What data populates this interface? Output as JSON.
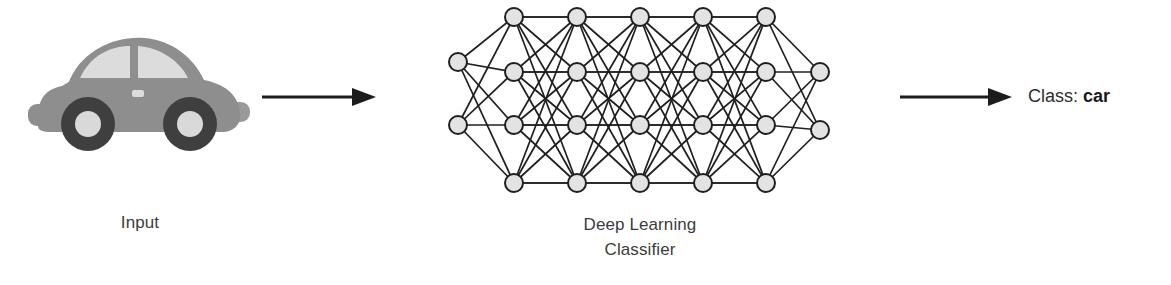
{
  "figure": {
    "background_color": "#ffffff"
  },
  "input": {
    "caption": "Input",
    "icon": "car-icon",
    "colors": {
      "body": "#8e8e8e",
      "body_shade": "#9a9a9a",
      "window": "#dcdcdc",
      "tire": "#3f3f3f",
      "hub": "#d9d9d9",
      "outline": "#8e8e8e"
    }
  },
  "arrows": [
    {
      "name": "arrow-input-to-model",
      "direction": "right",
      "color": "#1c1c1c",
      "length": 112
    },
    {
      "name": "arrow-model-to-output",
      "direction": "right",
      "color": "#1c1c1c",
      "length": 110
    }
  ],
  "model": {
    "caption": "Deep Learning\nClassifier",
    "caption_line_1": "Deep Learning",
    "caption_line_2": "Classifier",
    "colors": {
      "node_fill": "#e3e3e3",
      "node_stroke": "#1f1f1f",
      "edge": "#1f1f1f"
    },
    "architecture": {
      "layers": [
        {
          "name": "input-layer",
          "node_count": 2,
          "x": 18,
          "node_ys": [
            60,
            123
          ]
        },
        {
          "name": "hidden-layer-1",
          "node_count": 4,
          "x": 74,
          "node_ys": [
            15,
            70,
            123,
            181
          ]
        },
        {
          "name": "hidden-layer-2",
          "node_count": 4,
          "x": 137,
          "node_ys": [
            15,
            70,
            123,
            181
          ]
        },
        {
          "name": "hidden-layer-3",
          "node_count": 4,
          "x": 200,
          "node_ys": [
            15,
            70,
            123,
            181
          ]
        },
        {
          "name": "hidden-layer-4",
          "node_count": 4,
          "x": 263,
          "node_ys": [
            15,
            70,
            123,
            181
          ]
        },
        {
          "name": "hidden-layer-5",
          "node_count": 4,
          "x": 326,
          "node_ys": [
            15,
            70,
            123,
            181
          ]
        },
        {
          "name": "output-layer",
          "node_count": 2,
          "x": 380,
          "node_ys": [
            70,
            128
          ]
        }
      ],
      "node_radius": 9,
      "total_nodes": 24,
      "depth": 7
    }
  },
  "output": {
    "label_prefix": "Class:",
    "class_value": "car"
  }
}
